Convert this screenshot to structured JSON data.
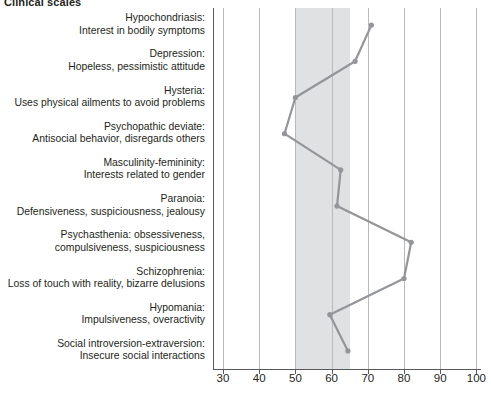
{
  "title": "Clinical scales",
  "chart_data": {
    "type": "line",
    "orientation": "horizontal",
    "title": "Clinical scales",
    "xlabel": "",
    "ylabel": "",
    "xlim": [
      25,
      103
    ],
    "grid": true,
    "legend": null,
    "normal_band": {
      "from": 50,
      "to": 65,
      "color": "#e0e1e2"
    },
    "line_color": "#939598",
    "marker_color": "#939598",
    "ticks": [
      30,
      40,
      50,
      60,
      70,
      80,
      90,
      100
    ],
    "categories": [
      "Hypochondriasis: Interest in bodily symptoms",
      "Depression: Hopeless, pessimistic attitude",
      "Hysteria: Uses physical ailments to avoid problems",
      "Psychopathic deviate: Antisocial behavior, disregards others",
      "Masculinity-femininity: Interests related to gender",
      "Paranoia: Defensiveness, suspiciousness, jealousy",
      "Psychasthenia: obsessiveness, compulsiveness, suspiciousness",
      "Schizophrenia: Loss of touch with reality, bizarre delusions",
      "Hypomania: Impulsiveness, overactivity",
      "Social introversion-extraversion: Insecure social interactions"
    ],
    "values": [
      71,
      66.5,
      50,
      47,
      62.5,
      61.5,
      82,
      80,
      59.5,
      64.5
    ]
  },
  "scales": [
    {
      "name": "hypochondriasis",
      "line1": "Hypochondriasis:",
      "line2": "Interest in bodily symptoms",
      "value": 71
    },
    {
      "name": "depression",
      "line1": "Depression:",
      "line2": "Hopeless, pessimistic attitude",
      "value": 66.5
    },
    {
      "name": "hysteria",
      "line1": "Hysteria:",
      "line2": "Uses physical ailments to avoid problems",
      "value": 50
    },
    {
      "name": "psychopathic-deviate",
      "line1": "Psychopathic deviate:",
      "line2": "Antisocial behavior, disregards others",
      "value": 47
    },
    {
      "name": "masculinity-femininity",
      "line1": "Masculinity-femininity:",
      "line2": "Interests related to gender",
      "value": 62.5
    },
    {
      "name": "paranoia",
      "line1": "Paranoia:",
      "line2": "Defensiveness, suspiciousness, jealousy",
      "value": 61.5
    },
    {
      "name": "psychasthenia",
      "line1": "Psychasthenia: obsessiveness,",
      "line2": "compulsiveness, suspiciousness",
      "value": 82
    },
    {
      "name": "schizophrenia",
      "line1": "Schizophrenia:",
      "line2": "Loss of touch with reality, bizarre delusions",
      "value": 80
    },
    {
      "name": "hypomania",
      "line1": "Hypomania:",
      "line2": "Impulsiveness, overactivity",
      "value": 59.5
    },
    {
      "name": "social-introversion",
      "line1": "Social introversion-extraversion:",
      "line2": "Insecure social interactions",
      "value": 64.5
    }
  ],
  "axis": {
    "ticks": [
      "30",
      "40",
      "50",
      "60",
      "70",
      "80",
      "90",
      "100"
    ]
  },
  "colors": {
    "line": "#939598",
    "band": "#e0e1e2",
    "grid": "#b9babc",
    "axis": "#58595b",
    "text": "#231f20"
  }
}
